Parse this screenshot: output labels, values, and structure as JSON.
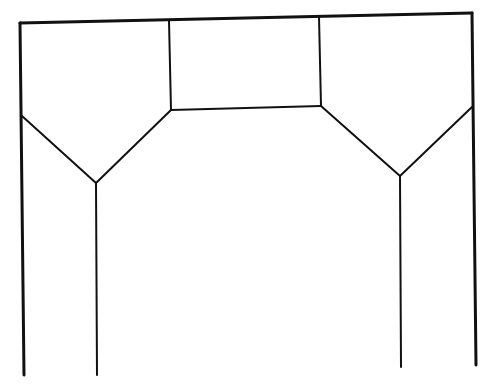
{
  "diagram": {
    "type": "line-drawing",
    "stroke_color": "#111111",
    "background_color": "#ffffff",
    "segments": [
      {
        "name": "top-beam",
        "points": [
          [
            20,
            23
          ],
          [
            472,
            13
          ]
        ],
        "width": 3
      },
      {
        "name": "left-outer-post",
        "points": [
          [
            20,
            23
          ],
          [
            24,
            375
          ]
        ],
        "width": 3
      },
      {
        "name": "right-outer-post",
        "points": [
          [
            472,
            13
          ],
          [
            476,
            365
          ]
        ],
        "width": 3
      },
      {
        "name": "center-left-post",
        "points": [
          [
            169,
            21
          ],
          [
            171,
            110
          ]
        ],
        "width": 2
      },
      {
        "name": "center-right-post",
        "points": [
          [
            319,
            17
          ],
          [
            321,
            106
          ]
        ],
        "width": 2
      },
      {
        "name": "center-bottom-beam",
        "points": [
          [
            171,
            110
          ],
          [
            321,
            106
          ]
        ],
        "width": 2
      },
      {
        "name": "left-v",
        "points": [
          [
            22,
            116
          ],
          [
            96,
            183
          ],
          [
            171,
            110
          ]
        ],
        "width": 2
      },
      {
        "name": "right-v",
        "points": [
          [
            321,
            106
          ],
          [
            400,
            176
          ],
          [
            472,
            107
          ]
        ],
        "width": 2
      },
      {
        "name": "left-inner-leg",
        "points": [
          [
            96,
            183
          ],
          [
            97,
            375
          ]
        ],
        "width": 2
      },
      {
        "name": "right-inner-leg",
        "points": [
          [
            400,
            176
          ],
          [
            401,
            367
          ]
        ],
        "width": 2
      }
    ]
  }
}
